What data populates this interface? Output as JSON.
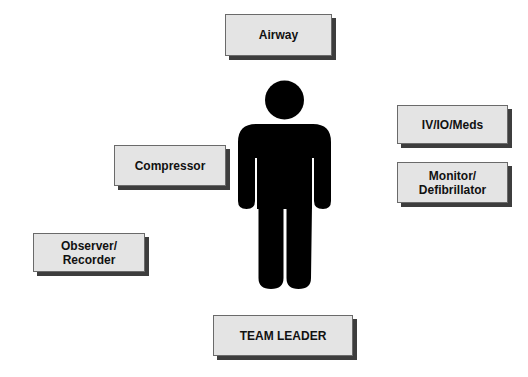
{
  "diagram": {
    "center_figure": {
      "icon": "person-silhouette-icon",
      "color": "#000000"
    },
    "roles": [
      {
        "id": "airway",
        "label": "Airway"
      },
      {
        "id": "iv-io-meds",
        "label": "IV/IO/Meds"
      },
      {
        "id": "monitor-defibrillator",
        "label": "Monitor/\nDefibrillator"
      },
      {
        "id": "compressor",
        "label": "Compressor"
      },
      {
        "id": "observer-recorder",
        "label": "Observer/\nRecorder"
      },
      {
        "id": "team-leader",
        "label": "TEAM LEADER"
      }
    ],
    "colors": {
      "box_fill": "#e4e4e4",
      "box_border": "#6a6a6a",
      "box_shadow": "#3d3d3d",
      "text": "#111111"
    }
  }
}
